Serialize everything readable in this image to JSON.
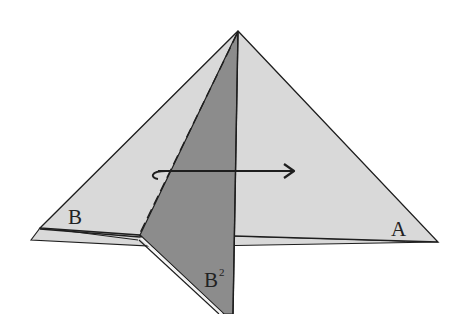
{
  "diagram": {
    "type": "origami-fold",
    "colors": {
      "paper_light": "#d9d9d9",
      "paper_dark": "#8c8c8c",
      "stroke": "#1e1e1e",
      "background": "#ffffff"
    },
    "labels": {
      "corner_a": "A",
      "corner_b": "B",
      "corner_b2": "B",
      "corner_b2_sup": "2"
    },
    "arrow": {
      "direction": "right",
      "meaning": "fold-over"
    }
  }
}
